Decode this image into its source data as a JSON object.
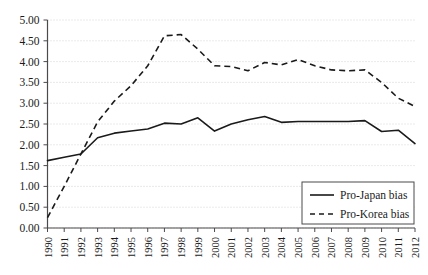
{
  "chart_data": {
    "type": "line",
    "title": "",
    "xlabel": "",
    "ylabel": "",
    "grid": true,
    "legend_position": "bottom-right",
    "categories": [
      "1990",
      "1991",
      "1992",
      "1993",
      "1994",
      "1995",
      "1996",
      "1997",
      "1998",
      "1999",
      "2000",
      "2001",
      "2002",
      "2003",
      "2004",
      "2005",
      "2006",
      "2007",
      "2008",
      "2009",
      "2010",
      "2011",
      "2012"
    ],
    "xlim": [
      1990,
      2012
    ],
    "ylim": [
      0.0,
      5.0
    ],
    "ytick_labels": [
      "0.00",
      "0.50",
      "1.00",
      "1.50",
      "2.00",
      "2.50",
      "3.00",
      "3.50",
      "4.00",
      "4.50",
      "5.00"
    ],
    "ytick_values": [
      0.0,
      0.5,
      1.0,
      1.5,
      2.0,
      2.5,
      3.0,
      3.5,
      4.0,
      4.5,
      5.0
    ],
    "series": [
      {
        "name": "Pro-Japan bias",
        "style": "solid",
        "color": "#1a1a1a",
        "values": [
          1.62,
          1.7,
          1.78,
          2.17,
          2.28,
          2.33,
          2.38,
          2.52,
          2.5,
          2.65,
          2.33,
          2.5,
          2.6,
          2.68,
          2.54,
          2.56,
          2.56,
          2.56,
          2.56,
          2.58,
          2.32,
          2.35,
          2.03
        ]
      },
      {
        "name": "Pro-Korea bias",
        "style": "dashed",
        "color": "#1a1a1a",
        "values": [
          0.25,
          1.0,
          1.78,
          2.55,
          3.05,
          3.42,
          3.9,
          4.62,
          4.65,
          4.3,
          3.9,
          3.88,
          3.78,
          3.98,
          3.92,
          4.05,
          3.9,
          3.8,
          3.78,
          3.8,
          3.5,
          3.12,
          2.92
        ]
      }
    ]
  },
  "legend": {
    "items": [
      {
        "label": "Pro-Japan bias",
        "style": "solid"
      },
      {
        "label": "Pro-Korea bias",
        "style": "dashed"
      }
    ]
  }
}
